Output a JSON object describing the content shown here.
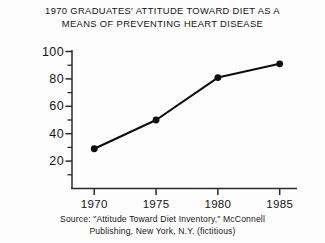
{
  "chart_data": {
    "type": "line",
    "title": "1970 GRADUATES' ATTITUDE TOWARD DIET AS A\nMEANS OF PREVENTING HEART DISEASE",
    "xlabel": "",
    "ylabel": "",
    "x": [
      1970,
      1975,
      1980,
      1985
    ],
    "categories": [
      "1970",
      "1975",
      "1980",
      "1985"
    ],
    "values": [
      29,
      50,
      81,
      91
    ],
    "series": [
      {
        "name": "Attitude toward diet",
        "values": [
          29,
          50,
          81,
          91
        ]
      }
    ],
    "ylim": [
      0,
      100
    ],
    "xlim": [
      1968.2,
      1986.4
    ],
    "yticks": [
      0,
      20,
      40,
      60,
      80,
      100
    ],
    "ytick_labels": [
      "",
      "20",
      "40",
      "60",
      "80",
      "100"
    ],
    "yminor_ticks": [
      10,
      30,
      50,
      70,
      90
    ],
    "xticks": [
      1970,
      1975,
      1980,
      1985
    ],
    "xtick_labels": [
      "1970",
      "1975",
      "1980",
      "1985"
    ],
    "grid": false,
    "legend": "none",
    "marker": "filled-circle",
    "line_color": "#0d0d0d",
    "marker_color": "#0d0d0d",
    "axis_color": "#2b2b2b",
    "background_color": "#fdfdfd"
  },
  "caption": {
    "source_text": "Source: \"Attitude Toward Diet Inventory,\" McConnell\nPublishing, New York, N.Y. (fictitious)"
  }
}
